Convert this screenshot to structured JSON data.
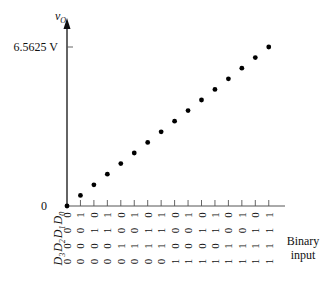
{
  "chart_data": {
    "type": "scatter",
    "title": "",
    "ylabel": "v_O",
    "ylabel_main": "v",
    "ylabel_sub": "O",
    "xlabel_lines": [
      "Binary",
      "input"
    ],
    "y_ticks": [
      {
        "value": 0,
        "label": "0"
      },
      {
        "value": 6.5625,
        "label": "6.5625 V"
      }
    ],
    "ylim": [
      0,
      7.8
    ],
    "bit_labels": [
      "D3",
      "D2",
      "D1",
      "D0"
    ],
    "bit_label_text": {
      "main": "D",
      "subs": [
        "3",
        "2",
        "1",
        "0"
      ]
    },
    "codes": [
      "0000",
      "0001",
      "0010",
      "0011",
      "0100",
      "0101",
      "0110",
      "0111",
      "1000",
      "1001",
      "1010",
      "1011",
      "1100",
      "1101",
      "1110",
      "1111"
    ],
    "x": [
      0,
      1,
      2,
      3,
      4,
      5,
      6,
      7,
      8,
      9,
      10,
      11,
      12,
      13,
      14,
      15
    ],
    "y": [
      0,
      0.4375,
      0.875,
      1.3125,
      1.75,
      2.1875,
      2.625,
      3.0625,
      3.5,
      3.9375,
      4.375,
      4.8125,
      5.25,
      5.6875,
      6.125,
      6.5625
    ],
    "grid": false,
    "legend": "none"
  }
}
